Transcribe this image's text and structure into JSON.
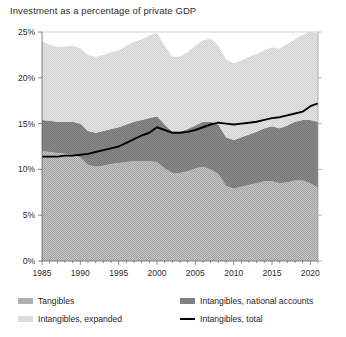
{
  "title": "Investment as a percentage of private GDP",
  "legend": {
    "items": [
      {
        "label": "Tangibles",
        "swatch": "tangibles-swatch",
        "color": "#b0b0b0",
        "kind": "area"
      },
      {
        "label": "Intangibles, national accounts",
        "swatch": "intangibles-national-accounts-swatch",
        "color": "#808080",
        "kind": "area"
      },
      {
        "label": "Intangibles, expanded",
        "swatch": "intangibles-expanded-swatch",
        "color": "#dcdcdc",
        "kind": "area"
      },
      {
        "label": "Intangibles, total",
        "swatch": "intangibles-total-swatch",
        "color": "#000000",
        "kind": "line"
      }
    ]
  },
  "axes": {
    "y_ticks": [
      "0%",
      "5%",
      "10%",
      "15%",
      "20%",
      "25%"
    ],
    "y_values": [
      0,
      5,
      10,
      15,
      20,
      25
    ],
    "x_ticks": [
      "1985",
      "1990",
      "1995",
      "2000",
      "2005",
      "2010",
      "2015",
      "2020"
    ],
    "x_values": [
      1985,
      1990,
      1995,
      2000,
      2005,
      2010,
      2015,
      2020
    ]
  },
  "chart_data": {
    "type": "area",
    "stacked": true,
    "title": "Investment as a percentage of private GDP",
    "xlabel": "",
    "ylabel": "",
    "xlim": [
      1985,
      2021
    ],
    "ylim": [
      0,
      25
    ],
    "grid": false,
    "legend_position": "bottom",
    "x": [
      1985,
      1986,
      1987,
      1988,
      1989,
      1990,
      1991,
      1992,
      1993,
      1994,
      1995,
      1996,
      1997,
      1998,
      1999,
      2000,
      2001,
      2002,
      2003,
      2004,
      2005,
      2006,
      2007,
      2008,
      2009,
      2010,
      2011,
      2012,
      2013,
      2014,
      2015,
      2016,
      2017,
      2018,
      2019,
      2020,
      2021
    ],
    "series": [
      {
        "name": "Tangibles",
        "color": "#b0b0b0",
        "values": [
          12.0,
          11.9,
          11.8,
          11.7,
          11.6,
          11.3,
          10.5,
          10.3,
          10.4,
          10.6,
          10.7,
          10.8,
          10.9,
          10.9,
          10.9,
          10.8,
          10.1,
          9.6,
          9.6,
          9.8,
          10.1,
          10.3,
          10.0,
          9.5,
          8.2,
          7.9,
          8.1,
          8.3,
          8.5,
          8.7,
          8.7,
          8.5,
          8.6,
          8.8,
          8.8,
          8.5,
          8.0
        ]
      },
      {
        "name": "Intangibles, national accounts",
        "color": "#808080",
        "values": [
          3.4,
          3.4,
          3.4,
          3.5,
          3.6,
          3.7,
          3.7,
          3.7,
          3.8,
          3.8,
          3.9,
          4.1,
          4.3,
          4.5,
          4.7,
          5.0,
          4.8,
          4.5,
          4.5,
          4.6,
          4.7,
          4.9,
          5.2,
          5.4,
          5.3,
          5.3,
          5.4,
          5.5,
          5.6,
          5.8,
          6.0,
          6.0,
          6.2,
          6.4,
          6.6,
          6.9,
          7.2
        ]
      },
      {
        "name": "Intangibles, expanded",
        "color": "#dcdcdc",
        "values": [
          8.6,
          8.3,
          8.2,
          8.2,
          8.3,
          8.2,
          8.3,
          8.3,
          8.3,
          8.4,
          8.4,
          8.6,
          8.7,
          8.8,
          9.0,
          9.1,
          8.6,
          8.2,
          8.2,
          8.4,
          8.7,
          8.9,
          9.1,
          8.6,
          8.5,
          8.4,
          8.4,
          8.5,
          8.5,
          8.5,
          8.6,
          8.7,
          8.9,
          9.0,
          9.3,
          9.6,
          9.6
        ]
      }
    ],
    "line_series": [
      {
        "name": "Intangibles, total",
        "color": "#000000",
        "values": [
          11.4,
          11.4,
          11.4,
          11.5,
          11.5,
          11.6,
          11.7,
          11.9,
          12.1,
          12.3,
          12.5,
          12.9,
          13.3,
          13.7,
          14.0,
          14.6,
          14.3,
          14.0,
          14.0,
          14.1,
          14.3,
          14.6,
          14.9,
          15.1,
          15.0,
          14.9,
          15.0,
          15.1,
          15.2,
          15.4,
          15.6,
          15.7,
          15.9,
          16.1,
          16.3,
          16.9,
          17.2
        ]
      }
    ]
  }
}
